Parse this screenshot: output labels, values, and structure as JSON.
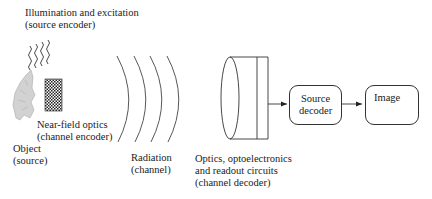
{
  "diagram": {
    "labels": {
      "illumination": [
        "Illumination and excitation",
        "(source encoder)"
      ],
      "near_field": [
        "Near-field optics",
        "(channel encoder)"
      ],
      "object": [
        "Object",
        "(source)"
      ],
      "radiation": [
        "Radiation",
        "(channel)"
      ],
      "optics": [
        "Optics, optoelectronics",
        "and readout circuits",
        "(channel decoder)"
      ]
    },
    "boxes": {
      "source_decoder": [
        "Source",
        "decoder"
      ],
      "image": "Image"
    },
    "icons": {
      "illumination": "wavy-lines-icon",
      "object": "rock-object-icon",
      "near_field": "checkered-grid-icon",
      "radiation": "wavefront-arcs-icon",
      "optics": "lens-cylinder-icon",
      "image": "rock-image-icon"
    },
    "colors": {
      "line": "#333333",
      "object_fill": "#cfcfcf",
      "image_fill": "#9a9a9a"
    }
  }
}
